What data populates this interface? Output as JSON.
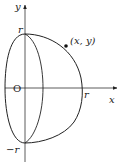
{
  "diagram": {
    "type": "solid-of-revolution sketch",
    "axes": {
      "x_label": "x",
      "y_label": "y",
      "origin_label": "O"
    },
    "labels": {
      "top": "r",
      "bottom": "−r",
      "right": "r",
      "point": "(x, y)"
    },
    "colors": {
      "stroke": "#222222",
      "background": "#ffffff"
    }
  }
}
